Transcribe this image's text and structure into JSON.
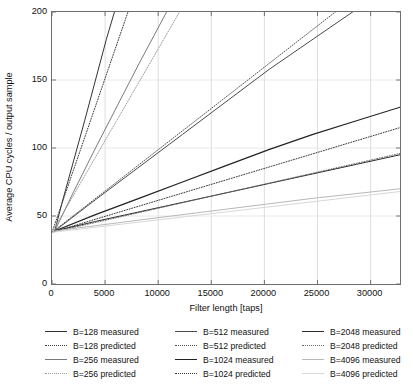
{
  "chart_data": {
    "type": "line",
    "title": "",
    "xlabel": "Filter length [taps]",
    "ylabel": "Average CPU cycles / output sample",
    "xlim": [
      0,
      32768
    ],
    "ylim": [
      0,
      200
    ],
    "xticks": [
      0,
      5000,
      10000,
      15000,
      20000,
      25000,
      30000
    ],
    "xticklabels": [
      "0",
      "5000",
      "10000",
      "15000",
      "20000",
      "25000",
      "30000"
    ],
    "yticks": [
      0,
      50,
      100,
      150,
      200
    ],
    "yticklabels": [
      "0",
      "50",
      "100",
      "150",
      "200"
    ],
    "grid": "vertical-and-horizontal-light",
    "legend_position": "below-axes",
    "legend_columns": 3,
    "series": [
      {
        "name": "B=128 measured",
        "style": "solid",
        "color": "#333333",
        "width": 1.0,
        "x": [
          256,
          1024,
          2048,
          3072,
          4096,
          5120,
          6144
        ],
        "y": [
          39,
          62,
          91,
          120,
          150,
          180,
          207
        ]
      },
      {
        "name": "B=128 predicted",
        "style": "dotted",
        "color": "#3d3d3d",
        "width": 1.0,
        "x": [
          0,
          32768
        ],
        "y": [
          38,
          780
        ]
      },
      {
        "name": "B=256 measured",
        "style": "solid",
        "color": "#7a7a7a",
        "width": 1.0,
        "x": [
          256,
          2048,
          4096,
          6144,
          8192,
          10240,
          11264
        ],
        "y": [
          39,
          68,
          100,
          131,
          162,
          192,
          207
        ]
      },
      {
        "name": "B=256 predicted",
        "style": "dotted",
        "color": "#9a9a9a",
        "width": 1.0,
        "x": [
          0,
          32768
        ],
        "y": [
          38,
          480
        ]
      },
      {
        "name": "B=512 measured",
        "style": "solid",
        "color": "#4a4a4a",
        "width": 1.0,
        "x": [
          256,
          4096,
          8192,
          12288,
          16384,
          20480,
          24576,
          28672
        ],
        "y": [
          39,
          62,
          86,
          110,
          134,
          158,
          180,
          202
        ]
      },
      {
        "name": "B=512 predicted",
        "style": "dotted",
        "color": "#555555",
        "width": 1.0,
        "x": [
          0,
          32768
        ],
        "y": [
          38,
          237
        ]
      },
      {
        "name": "B=1024 measured",
        "style": "solid",
        "color": "#222222",
        "width": 1.2,
        "x": [
          256,
          4096,
          8192,
          12288,
          16384,
          20480,
          24576,
          28672,
          32768
        ],
        "y": [
          39,
          51,
          63,
          75,
          87,
          99,
          110,
          120,
          130
        ]
      },
      {
        "name": "B=1024 predicted",
        "style": "dotted",
        "color": "#3a3a3a",
        "width": 1.0,
        "x": [
          0,
          32768
        ],
        "y": [
          38,
          115
        ]
      },
      {
        "name": "B=2048 measured",
        "style": "solid",
        "color": "#2b2b2b",
        "width": 1.0,
        "x": [
          256,
          4096,
          8192,
          12288,
          16384,
          20480,
          24576,
          28672,
          32768
        ],
        "y": [
          39,
          46,
          53,
          60,
          67,
          74,
          81,
          88,
          95
        ]
      },
      {
        "name": "B=2048 predicted",
        "style": "dotted",
        "color": "#6a6a6a",
        "width": 1.0,
        "x": [
          0,
          32768
        ],
        "y": [
          38,
          96
        ]
      },
      {
        "name": "B=4096 measured",
        "style": "solid",
        "color": "#b8b8b8",
        "width": 1.0,
        "x": [
          256,
          8192,
          16384,
          24576,
          32768
        ],
        "y": [
          39,
          47,
          55,
          63,
          70
        ]
      },
      {
        "name": "B=4096 predicted",
        "style": "solid",
        "color": "#d8d8d8",
        "width": 1.0,
        "x": [
          0,
          32768
        ],
        "y": [
          38,
          68
        ]
      }
    ]
  },
  "axes": {
    "ylabel": "Average CPU cycles / output sample",
    "xlabel": "Filter length [taps]",
    "yticklabels": [
      "200",
      "150",
      "100",
      "50",
      "0"
    ],
    "xticklabels": [
      "0",
      "5000",
      "10000",
      "15000",
      "20000",
      "25000",
      "30000"
    ]
  },
  "legend": {
    "columns": [
      {
        "items": [
          {
            "label": "B=128 measured",
            "style": "solid",
            "color": "#333333"
          },
          {
            "label": "B=128 predicted",
            "style": "dotted",
            "color": "#3d3d3d"
          },
          {
            "label": "B=256 measured",
            "style": "solid",
            "color": "#7a7a7a"
          },
          {
            "label": "B=256 predicted",
            "style": "dotted",
            "color": "#9a9a9a"
          }
        ]
      },
      {
        "items": [
          {
            "label": "B=512 measured",
            "style": "solid",
            "color": "#4a4a4a"
          },
          {
            "label": "B=512 predicted",
            "style": "dotted",
            "color": "#555555"
          },
          {
            "label": "B=1024 measured",
            "style": "solid",
            "color": "#222222"
          },
          {
            "label": "B=1024 predicted",
            "style": "dotted",
            "color": "#3a3a3a"
          }
        ]
      },
      {
        "items": [
          {
            "label": "B=2048 measured",
            "style": "solid",
            "color": "#2b2b2b"
          },
          {
            "label": "B=2048 predicted",
            "style": "dotted",
            "color": "#6a6a6a"
          },
          {
            "label": "B=4096 measured",
            "style": "solid",
            "color": "#b8b8b8"
          },
          {
            "label": "B=4096 predicted",
            "style": "solid",
            "color": "#d8d8d8"
          }
        ]
      }
    ]
  }
}
